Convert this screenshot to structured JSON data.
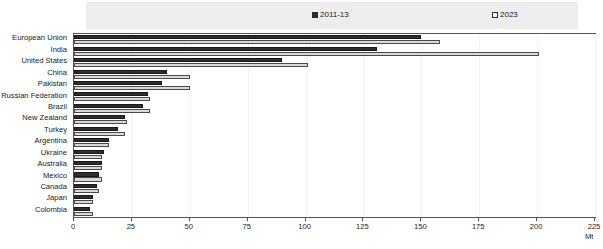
{
  "chart_data": {
    "type": "bar",
    "orientation": "horizontal",
    "title": "",
    "subtitle": "",
    "xlabel": "Mt",
    "ylabel": "",
    "xlim": [
      0,
      225
    ],
    "xticks": [
      0,
      25,
      50,
      75,
      100,
      125,
      150,
      175,
      200,
      225
    ],
    "grid": false,
    "legend_position": "top",
    "unit": "Mt",
    "categories": [
      "European Union",
      "India",
      "United States",
      "China",
      "Pakistan",
      "Russian Federation",
      "Brazil",
      "New Zealand",
      "Turkey",
      "Argentina",
      "Ukraine",
      "Australia",
      "Mexico",
      "Canada",
      "Japan",
      "Colombia"
    ],
    "series": [
      {
        "name": "2011-13",
        "color": "#2e2e2e",
        "values": [
          150,
          131,
          90,
          40,
          38,
          32,
          30,
          22,
          19,
          15,
          13,
          12,
          11,
          10,
          8,
          7
        ]
      },
      {
        "name": "2023",
        "color": "#d9d9d9",
        "values": [
          158,
          201,
          101,
          50,
          50,
          33,
          33,
          23,
          22,
          15,
          12,
          12,
          12,
          11,
          8,
          8
        ]
      }
    ]
  },
  "legend": {
    "entries": [
      {
        "label": "2011-13",
        "swatch": "#2e2e2e"
      },
      {
        "label": "2023",
        "swatch": "#ffffff"
      }
    ]
  },
  "axis": {
    "x_tick_labels": [
      "0",
      "25",
      "50",
      "75",
      "100",
      "125",
      "150",
      "175",
      "200",
      "225"
    ],
    "unit_label": "Mt"
  },
  "colors": {
    "series_2011_13": "#2e2e2e",
    "series_2023": "#d9d9d9",
    "legend_band": "#ededed",
    "frame": "#555555"
  }
}
